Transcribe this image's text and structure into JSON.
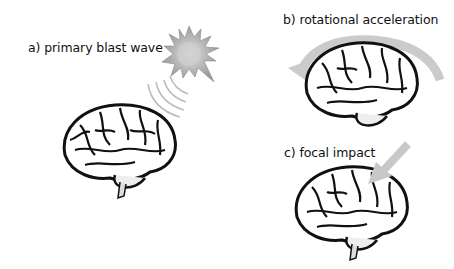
{
  "panels": [
    {
      "id": "a",
      "label": "a) primary blast wave",
      "mechanism": "blast-wave"
    },
    {
      "id": "b",
      "label": "b) rotational acceleration",
      "mechanism": "rotation"
    },
    {
      "id": "c",
      "label": "c) focal impact",
      "mechanism": "impact"
    }
  ],
  "colors": {
    "arrow": "#c8c8c8",
    "brain_ink": "#111111",
    "star": "#b4b4b4"
  }
}
